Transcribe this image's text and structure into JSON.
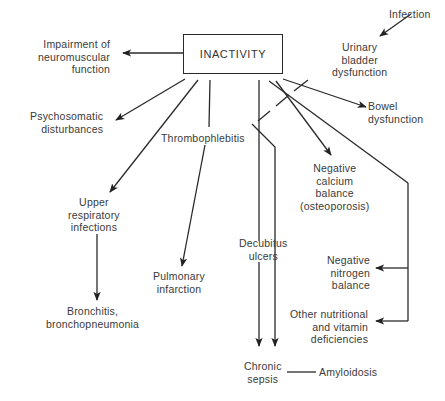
{
  "diagram": {
    "title": "INACTIVITY",
    "nodes": {
      "central": "INACTIVITY",
      "impairment": "Impairment of\nneuromuscular\nfunction",
      "psychosomatic": "Psychosomatic\ndisturbances",
      "thrombophlebitis": "Thrombophlebitis",
      "upper_respiratory": "Upper\nrespiratory\ninfections",
      "bronchitis": "Bronchitis,\nbronchopneumonia",
      "pulmonary": "Pulmonary\ninfarction",
      "decubitus": "Decubitus\nulcers",
      "chronic_sepsis": "Chronic\nsepsis",
      "amyloidosis": "Amyloidosis",
      "infection": "Infection",
      "urinary": "Urinary\nbladder\ndysfunction",
      "bowel": "Bowel\ndysfunction",
      "calcium": "Negative\ncalcium\nbalance\n(osteoporosis)",
      "nitrogen": "Negative\nnitrogen\nbalance",
      "nutritional": "Other nutritional\nand vitamin\ndeficiencies"
    },
    "edges": [
      {
        "from": "INACTIVITY",
        "to": "Impairment of neuromuscular function"
      },
      {
        "from": "INACTIVITY",
        "to": "Psychosomatic disturbances"
      },
      {
        "from": "INACTIVITY",
        "to": "Upper respiratory infections"
      },
      {
        "from": "INACTIVITY",
        "to": "Thrombophlebitis"
      },
      {
        "from": "Thrombophlebitis",
        "to": "Pulmonary infarction"
      },
      {
        "from": "Upper respiratory infections",
        "to": "Bronchitis, bronchopneumonia"
      },
      {
        "from": "INACTIVITY",
        "to": "Chronic sepsis",
        "via": "Decubitus ulcers"
      },
      {
        "from": "Urinary bladder dysfunction",
        "to": "Chronic sepsis"
      },
      {
        "from": "Infection",
        "to": "Urinary bladder dysfunction"
      },
      {
        "from": "INACTIVITY",
        "to": "Bowel dysfunction"
      },
      {
        "from": "INACTIVITY",
        "to": "Negative calcium balance (osteoporosis)"
      },
      {
        "from": "INACTIVITY",
        "to": "Negative nitrogen balance"
      },
      {
        "from": "INACTIVITY",
        "to": "Other nutritional and vitamin deficiencies"
      },
      {
        "from": "Chronic sepsis",
        "to": "Amyloidosis",
        "arrow": false
      }
    ]
  }
}
